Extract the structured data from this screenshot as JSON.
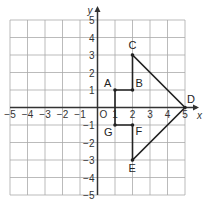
{
  "axes": {
    "x_label": "x",
    "y_label": "y",
    "origin_label": "O",
    "x_ticks": [
      "−5",
      "−4",
      "−3",
      "−2",
      "−1",
      "1",
      "2",
      "3",
      "4",
      "5"
    ],
    "y_ticks": [
      "5",
      "4",
      "3",
      "2",
      "1",
      "−1",
      "−2",
      "−3",
      "−4",
      "−5"
    ],
    "range": [
      -5,
      5
    ]
  },
  "points": [
    {
      "label": "A",
      "x": 1,
      "y": 1
    },
    {
      "label": "B",
      "x": 2,
      "y": 1
    },
    {
      "label": "C",
      "x": 2,
      "y": 3
    },
    {
      "label": "D",
      "x": 5,
      "y": 0
    },
    {
      "label": "E",
      "x": 2,
      "y": -3
    },
    {
      "label": "F",
      "x": 2,
      "y": -1
    },
    {
      "label": "G",
      "x": 1,
      "y": -1
    }
  ],
  "polygon_order": [
    "A",
    "B",
    "C",
    "D",
    "E",
    "F",
    "G"
  ],
  "colors": {
    "grid": "#aaaaaa",
    "axis": "#333333",
    "shape": "#222222"
  }
}
